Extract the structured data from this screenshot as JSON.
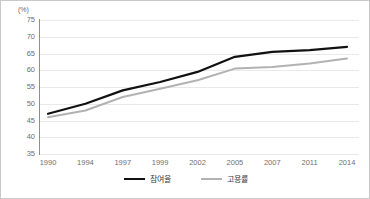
{
  "axis": {
    "unit_label": "(%)",
    "y_ticks": [
      75,
      70,
      65,
      60,
      55,
      50,
      45,
      40,
      35
    ],
    "x_ticks": [
      "1990",
      "1994",
      "1997",
      "1999",
      "2002",
      "2005",
      "2007",
      "2011",
      "2014"
    ]
  },
  "legend": {
    "items": [
      {
        "label": "참여율",
        "color": "#111111",
        "style": "thick"
      },
      {
        "label": "고용률",
        "color": "#b2b2b2",
        "style": "thin"
      }
    ]
  },
  "colors": {
    "participation_line": "#111111",
    "employment_line": "#b2b2b2",
    "gridline": "#e9e9e9",
    "axis": "#8f8f8f",
    "tick_text": "#6f6f6f",
    "border": "#c9c9c9"
  },
  "chart_data": {
    "type": "line",
    "title": "",
    "xlabel": "",
    "ylabel": "(%)",
    "ylim": [
      35,
      75
    ],
    "ytick_step": 5,
    "grid": true,
    "legend_position": "bottom-center",
    "categories": [
      "1990",
      "1994",
      "1997",
      "1999",
      "2002",
      "2005",
      "2007",
      "2011",
      "2014"
    ],
    "series": [
      {
        "name": "참여율",
        "color": "#111111",
        "values": [
          47.0,
          50.0,
          54.0,
          56.5,
          59.5,
          64.0,
          65.5,
          66.0,
          67.0
        ]
      },
      {
        "name": "고용률",
        "color": "#b2b2b2",
        "values": [
          46.0,
          48.0,
          52.0,
          54.5,
          57.0,
          60.5,
          61.0,
          62.0,
          63.5
        ]
      }
    ]
  }
}
